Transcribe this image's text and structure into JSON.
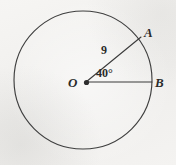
{
  "figure": {
    "type": "circle-central-angle-diagram",
    "background_color": "#f3f2f0",
    "stroke_color": "#3a3a3a",
    "circle": {
      "center_label": "O",
      "center_x": 83,
      "center_y": 80,
      "radius_px": 69
    },
    "points": [
      {
        "name": "center-point",
        "label": "O",
        "x": 86,
        "y": 82
      },
      {
        "name": "point-a",
        "label": "A",
        "x": 140,
        "y": 38
      },
      {
        "name": "point-b",
        "label": "B",
        "x": 152,
        "y": 82
      }
    ],
    "radii": [
      {
        "name": "radius-oa",
        "from": "O",
        "to": "A",
        "length_label": "9"
      },
      {
        "name": "radius-ob",
        "from": "O",
        "to": "B",
        "length_label": ""
      }
    ],
    "angle": {
      "name": "central-angle-aob",
      "vertex": "O",
      "label": "40°",
      "value": 40,
      "unit": "degrees"
    },
    "labels": {
      "point_a": "A",
      "point_b": "B",
      "center": "O",
      "radius_length": "9",
      "angle_measure": "40°"
    }
  }
}
